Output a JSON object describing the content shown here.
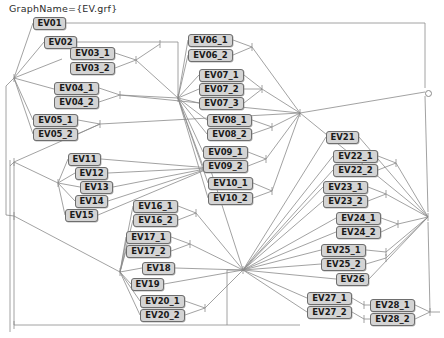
{
  "title": "GraphName={EV.grf}",
  "canvas": {
    "width": 444,
    "height": 338,
    "background": "#ffffff"
  },
  "style": {
    "node_fill": "#d4d4d4",
    "node_border": "#6e6e6e",
    "edge_color": "#8a8a8a",
    "text_color": "#1a1a1a"
  },
  "nodes": [
    {
      "id": "EV01",
      "label": "EV01",
      "x": 33,
      "y": 17,
      "w": 33
    },
    {
      "id": "EV02",
      "label": "EV02",
      "x": 44,
      "y": 36,
      "w": 33
    },
    {
      "id": "EV03_1",
      "label": "EV03_1",
      "x": 70,
      "y": 47,
      "w": 45
    },
    {
      "id": "EV03_2",
      "label": "EV03_2",
      "x": 70,
      "y": 62,
      "w": 45
    },
    {
      "id": "EV04_1",
      "label": "EV04_1",
      "x": 54,
      "y": 82,
      "w": 45
    },
    {
      "id": "EV04_2",
      "label": "EV04_2",
      "x": 54,
      "y": 96,
      "w": 45
    },
    {
      "id": "EV05_1",
      "label": "EV05_1",
      "x": 33,
      "y": 114,
      "w": 45
    },
    {
      "id": "EV05_2",
      "label": "EV05_2",
      "x": 33,
      "y": 128,
      "w": 45
    },
    {
      "id": "EV06_1",
      "label": "EV06_1",
      "x": 188,
      "y": 34,
      "w": 45
    },
    {
      "id": "EV06_2",
      "label": "EV06_2",
      "x": 188,
      "y": 49,
      "w": 45
    },
    {
      "id": "EV07_1",
      "label": "EV07_1",
      "x": 199,
      "y": 69,
      "w": 45
    },
    {
      "id": "EV07_2",
      "label": "EV07_2",
      "x": 199,
      "y": 83,
      "w": 45
    },
    {
      "id": "EV07_3",
      "label": "EV07_3",
      "x": 199,
      "y": 97,
      "w": 45
    },
    {
      "id": "EV08_1",
      "label": "EV08_1",
      "x": 207,
      "y": 114,
      "w": 45
    },
    {
      "id": "EV08_2",
      "label": "EV08_2",
      "x": 207,
      "y": 128,
      "w": 45
    },
    {
      "id": "EV09_1",
      "label": "EV09_1",
      "x": 203,
      "y": 146,
      "w": 45
    },
    {
      "id": "EV09_2",
      "label": "EV09_2",
      "x": 203,
      "y": 160,
      "w": 45
    },
    {
      "id": "EV10_1",
      "label": "EV10_1",
      "x": 208,
      "y": 177,
      "w": 45
    },
    {
      "id": "EV10_2",
      "label": "EV10_2",
      "x": 208,
      "y": 192,
      "w": 45
    },
    {
      "id": "EV11",
      "label": "EV11",
      "x": 68,
      "y": 153,
      "w": 33
    },
    {
      "id": "EV12",
      "label": "EV12",
      "x": 75,
      "y": 167,
      "w": 33
    },
    {
      "id": "EV13",
      "label": "EV13",
      "x": 80,
      "y": 181,
      "w": 33
    },
    {
      "id": "EV14",
      "label": "EV14",
      "x": 75,
      "y": 195,
      "w": 33
    },
    {
      "id": "EV15",
      "label": "EV15",
      "x": 65,
      "y": 209,
      "w": 33
    },
    {
      "id": "EV16_1",
      "label": "EV16_1",
      "x": 133,
      "y": 200,
      "w": 45
    },
    {
      "id": "EV16_2",
      "label": "EV16_2",
      "x": 133,
      "y": 214,
      "w": 45
    },
    {
      "id": "EV17_1",
      "label": "EV17_1",
      "x": 126,
      "y": 231,
      "w": 45
    },
    {
      "id": "EV17_2",
      "label": "EV17_2",
      "x": 126,
      "y": 245,
      "w": 45
    },
    {
      "id": "EV18",
      "label": "EV18",
      "x": 142,
      "y": 262,
      "w": 33
    },
    {
      "id": "EV19",
      "label": "EV19",
      "x": 131,
      "y": 278,
      "w": 33
    },
    {
      "id": "EV20_1",
      "label": "EV20_1",
      "x": 140,
      "y": 295,
      "w": 45
    },
    {
      "id": "EV20_2",
      "label": "EV20_2",
      "x": 140,
      "y": 309,
      "w": 45
    },
    {
      "id": "EV21",
      "label": "EV21",
      "x": 326,
      "y": 131,
      "w": 33
    },
    {
      "id": "EV22_1",
      "label": "EV22_1",
      "x": 333,
      "y": 150,
      "w": 45
    },
    {
      "id": "EV22_2",
      "label": "EV22_2",
      "x": 333,
      "y": 164,
      "w": 45
    },
    {
      "id": "EV23_1",
      "label": "EV23_1",
      "x": 323,
      "y": 181,
      "w": 45
    },
    {
      "id": "EV23_2",
      "label": "EV23_2",
      "x": 323,
      "y": 195,
      "w": 45
    },
    {
      "id": "EV24_1",
      "label": "EV24_1",
      "x": 336,
      "y": 212,
      "w": 45
    },
    {
      "id": "EV24_2",
      "label": "EV24_2",
      "x": 336,
      "y": 226,
      "w": 45
    },
    {
      "id": "EV25_1",
      "label": "EV25_1",
      "x": 321,
      "y": 244,
      "w": 45
    },
    {
      "id": "EV25_2",
      "label": "EV25_2",
      "x": 321,
      "y": 258,
      "w": 45
    },
    {
      "id": "EV26",
      "label": "EV26",
      "x": 336,
      "y": 273,
      "w": 33
    },
    {
      "id": "EV27_1",
      "label": "EV27_1",
      "x": 307,
      "y": 292,
      "w": 45
    },
    {
      "id": "EV27_2",
      "label": "EV27_2",
      "x": 307,
      "y": 306,
      "w": 45
    },
    {
      "id": "EV28_1",
      "label": "EV28_1",
      "x": 370,
      "y": 299,
      "w": 45
    },
    {
      "id": "EV28_2",
      "label": "EV28_2",
      "x": 370,
      "y": 313,
      "w": 45
    }
  ],
  "terminal_nodes": [
    {
      "id": "terminal-right",
      "x": 425,
      "y": 90
    }
  ],
  "junctions": [
    {
      "id": "j-left-top",
      "x": 14,
      "y": 78
    },
    {
      "id": "j-left-mid",
      "x": 14,
      "y": 162
    },
    {
      "id": "j-left-bottom",
      "x": 14,
      "y": 216
    },
    {
      "id": "j-ev11-fan",
      "x": 58,
      "y": 183
    },
    {
      "id": "j-center-top",
      "x": 178,
      "y": 98
    },
    {
      "id": "j-center-main",
      "x": 300,
      "y": 113
    },
    {
      "id": "j-center-low",
      "x": 243,
      "y": 270
    },
    {
      "id": "j-right-fan",
      "x": 428,
      "y": 217
    },
    {
      "id": "j-bottom-left",
      "x": 14,
      "y": 325
    }
  ],
  "edge_tick_marks": true,
  "edges": [
    {
      "from": "j-left-top",
      "to": "EV01"
    },
    {
      "from": "j-left-top",
      "to": "EV02"
    },
    {
      "from": "j-left-top",
      "to": "EV03"
    },
    {
      "from": "j-left-top",
      "to": "EV04"
    },
    {
      "from": "j-left-top",
      "to": "EV05"
    },
    {
      "from": "EV01",
      "to": "terminal-right"
    },
    {
      "from": "EV02",
      "to": "j-center-top"
    },
    {
      "from": "EV03",
      "to": "j-center-top"
    },
    {
      "from": "EV04",
      "to": "j-center-main"
    },
    {
      "from": "EV05",
      "to": "j-center-main"
    },
    {
      "from": "j-center-top",
      "to": "EV06"
    },
    {
      "from": "j-center-main",
      "to": "EV07"
    },
    {
      "from": "j-center-main",
      "to": "EV08"
    },
    {
      "from": "j-center-main",
      "to": "EV09"
    },
    {
      "from": "j-center-main",
      "to": "EV10"
    },
    {
      "from": "j-left-mid",
      "to": "j-ev11-fan"
    },
    {
      "from": "j-ev11-fan",
      "to": "EV11"
    },
    {
      "from": "j-ev11-fan",
      "to": "EV12"
    },
    {
      "from": "j-ev11-fan",
      "to": "EV13"
    },
    {
      "from": "j-ev11-fan",
      "to": "EV14"
    },
    {
      "from": "j-ev11-fan",
      "to": "EV15"
    },
    {
      "from": "j-center-low",
      "to": "EV16"
    },
    {
      "from": "j-center-low",
      "to": "EV17"
    },
    {
      "from": "j-center-low",
      "to": "EV18"
    },
    {
      "from": "j-center-low",
      "to": "EV19"
    },
    {
      "from": "j-center-low",
      "to": "EV20"
    },
    {
      "from": "j-center-low",
      "to": "EV21"
    },
    {
      "from": "j-center-low",
      "to": "EV22"
    },
    {
      "from": "j-center-low",
      "to": "EV23"
    },
    {
      "from": "j-center-low",
      "to": "EV24"
    },
    {
      "from": "j-center-low",
      "to": "EV25"
    },
    {
      "from": "j-center-low",
      "to": "EV26"
    },
    {
      "from": "j-center-low",
      "to": "EV27"
    },
    {
      "from": "EV21",
      "to": "j-right-fan"
    },
    {
      "from": "EV22",
      "to": "j-right-fan"
    },
    {
      "from": "EV23",
      "to": "j-right-fan"
    },
    {
      "from": "EV24",
      "to": "j-right-fan"
    },
    {
      "from": "EV25",
      "to": "j-right-fan"
    },
    {
      "from": "EV26",
      "to": "j-right-fan"
    },
    {
      "from": "EV27",
      "to": "EV28"
    },
    {
      "from": "EV28",
      "to": "j-right-fan"
    },
    {
      "from": "terminal-right",
      "to": "j-right-fan"
    }
  ]
}
